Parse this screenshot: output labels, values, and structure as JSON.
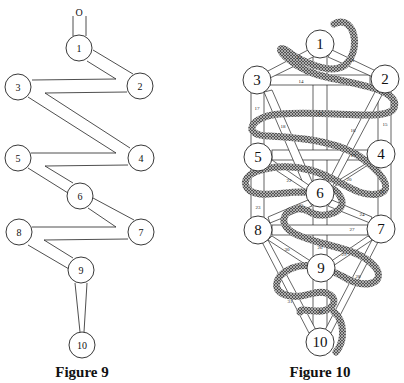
{
  "figure9": {
    "caption": "Figure 9",
    "top_label": "O",
    "nodes": [
      {
        "label": "1",
        "x": 79,
        "y": 48
      },
      {
        "label": "2",
        "x": 140,
        "y": 86
      },
      {
        "label": "3",
        "x": 18,
        "y": 87
      },
      {
        "label": "4",
        "x": 141,
        "y": 158
      },
      {
        "label": "5",
        "x": 18,
        "y": 158
      },
      {
        "label": "6",
        "x": 80,
        "y": 196
      },
      {
        "label": "7",
        "x": 141,
        "y": 232
      },
      {
        "label": "8",
        "x": 19,
        "y": 232
      },
      {
        "label": "9",
        "x": 81,
        "y": 270
      },
      {
        "label": "10",
        "x": 82,
        "y": 345
      }
    ]
  },
  "figure10": {
    "caption": "Figure 10",
    "nodes": [
      {
        "label": "1",
        "x": 320,
        "y": 44
      },
      {
        "label": "2",
        "x": 385,
        "y": 79
      },
      {
        "label": "3",
        "x": 257,
        "y": 80
      },
      {
        "label": "4",
        "x": 381,
        "y": 154
      },
      {
        "label": "5",
        "x": 258,
        "y": 157
      },
      {
        "label": "6",
        "x": 320,
        "y": 193
      },
      {
        "label": "7",
        "x": 381,
        "y": 229
      },
      {
        "label": "8",
        "x": 258,
        "y": 230
      },
      {
        "label": "9",
        "x": 321,
        "y": 268
      },
      {
        "label": "10",
        "x": 320,
        "y": 342
      }
    ],
    "paths": [
      {
        "label": "11",
        "x": 352,
        "y": 60
      },
      {
        "label": "12",
        "x": 299,
        "y": 57
      },
      {
        "label": "13",
        "x": 320,
        "y": 113
      },
      {
        "label": "14",
        "x": 301,
        "y": 81
      },
      {
        "label": "15",
        "x": 385,
        "y": 124
      },
      {
        "label": "16",
        "x": 353,
        "y": 130
      },
      {
        "label": "17",
        "x": 257,
        "y": 108
      },
      {
        "label": "18",
        "x": 283,
        "y": 126
      },
      {
        "label": "19",
        "x": 353,
        "y": 155
      },
      {
        "label": "20",
        "x": 349,
        "y": 179
      },
      {
        "label": "21",
        "x": 382,
        "y": 191
      },
      {
        "label": "22",
        "x": 289,
        "y": 180
      },
      {
        "label": "23",
        "x": 258,
        "y": 207
      },
      {
        "label": "24",
        "x": 362,
        "y": 214
      },
      {
        "label": "25",
        "x": 301,
        "y": 205
      },
      {
        "label": "26",
        "x": 320,
        "y": 247
      },
      {
        "label": "27",
        "x": 352,
        "y": 229
      },
      {
        "label": "28",
        "x": 358,
        "y": 276
      },
      {
        "label": "29",
        "x": 344,
        "y": 254
      },
      {
        "label": "30",
        "x": 287,
        "y": 249
      },
      {
        "label": "31",
        "x": 290,
        "y": 301
      },
      {
        "label": "32",
        "x": 320,
        "y": 311
      }
    ]
  }
}
